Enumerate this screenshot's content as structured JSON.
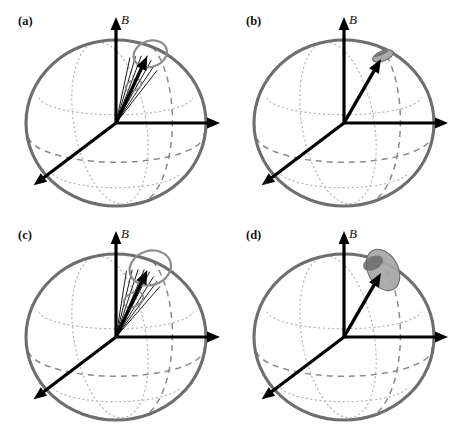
{
  "figure": {
    "type": "bloch-sphere-panel-grid",
    "background_color": "#ffffff",
    "rows": 2,
    "columns": 2,
    "width": 455,
    "height": 427
  },
  "style": {
    "sphere_outline_color": "#6e6e6e",
    "sphere_outline_width": 3.1,
    "dotted_grid_color": "#b8b8b8",
    "dashed_grid_color": "#8a8a8a",
    "axis_color": "#000000",
    "axis_width": 3.2,
    "vector_color": "#000000",
    "cone_line_color": "#1a1a1a",
    "precession_ring_color": "#8c8c8c",
    "blob_fill_color": "#a6a6a6",
    "blob_dark_color": "#6b6b6b",
    "label_color": "#111111"
  },
  "axes": {
    "field_axis_label": "B",
    "field_axis_name": "vertical-field-axis",
    "horizontal_axis_name": "horizontal-axis",
    "diagonal_axis_name": "diagonal-depth-axis"
  },
  "panels": [
    {
      "id": "a",
      "label": "(a)",
      "cx": 116,
      "cy": 123,
      "rx": 90,
      "ry": 83,
      "label_x": 18,
      "label_y": 14,
      "field_label_x": 121,
      "field_label_y": 12,
      "state": "narrow-cone-with-precession-ring",
      "vector_angle_deg": 25,
      "vector_length": 74,
      "cone_half_angle_deg": 13,
      "cone_line_count": 7,
      "ring_rx": 17,
      "ring_ry": 13,
      "ring_filled": false,
      "inner_ring": true
    },
    {
      "id": "b",
      "label": "(b)",
      "cx": 344,
      "cy": 123,
      "rx": 90,
      "ry": 83,
      "label_x": 246,
      "label_y": 14,
      "field_label_x": 349,
      "field_label_y": 12,
      "state": "single-vector-small-tip-blob",
      "vector_angle_deg": 30,
      "vector_length": 74,
      "cone_half_angle_deg": 0,
      "cone_line_count": 0,
      "ring_rx": 11,
      "ring_ry": 5,
      "ring_filled": true,
      "inner_ring": false
    },
    {
      "id": "c",
      "label": "(c)",
      "cx": 116,
      "cy": 337,
      "rx": 90,
      "ry": 83,
      "label_x": 18,
      "label_y": 228,
      "field_label_x": 121,
      "field_label_y": 226,
      "state": "wide-cone-with-large-precession-ring",
      "vector_angle_deg": 25,
      "vector_length": 74,
      "cone_half_angle_deg": 16,
      "cone_line_count": 8,
      "ring_rx": 21,
      "ring_ry": 17,
      "ring_filled": false,
      "inner_ring": true
    },
    {
      "id": "d",
      "label": "(d)",
      "cx": 344,
      "cy": 337,
      "rx": 90,
      "ry": 83,
      "label_x": 246,
      "label_y": 228,
      "field_label_x": 349,
      "field_label_y": 226,
      "state": "single-vector-large-filled-blob",
      "vector_angle_deg": 30,
      "vector_length": 74,
      "cone_half_angle_deg": 0,
      "cone_line_count": 0,
      "ring_rx": 15,
      "ring_ry": 22,
      "ring_filled": true,
      "inner_ring": false
    }
  ]
}
